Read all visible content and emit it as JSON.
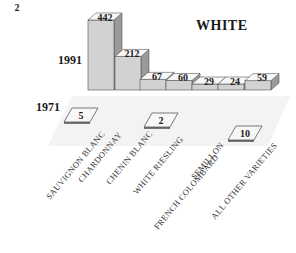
{
  "chart_data": {
    "type": "bar",
    "title": "WHITE",
    "style": "3d",
    "categories": [
      "SAUVIGNON BLANC",
      "CHARDONNAY",
      "CHENIN BLANC",
      "WHITE RIESLING",
      "FRENCH COLOMBARD",
      "SEMILLON",
      "ALL OTHER VARIETIES"
    ],
    "series": [
      {
        "name": "1991",
        "values": [
          442,
          212,
          67,
          60,
          29,
          24,
          59
        ]
      },
      {
        "name": "1971",
        "values": [
          5,
          null,
          2,
          2,
          null,
          null,
          10
        ]
      }
    ],
    "xlabel": "",
    "ylabel": "",
    "grid": false,
    "legend_position": "left (row labels)"
  },
  "labels": {
    "title": "WHITE",
    "row_1991": "1991",
    "row_1971": "1971"
  }
}
